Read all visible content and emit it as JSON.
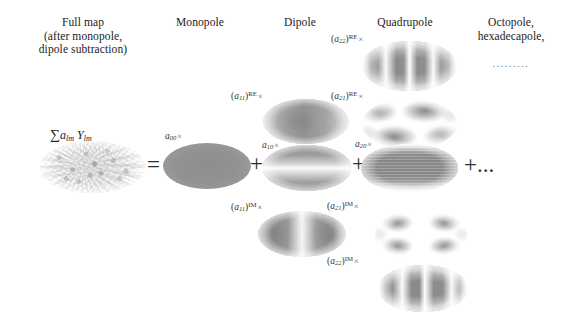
{
  "figure": {
    "type": "spherical-harmonic-decomposition"
  },
  "headers": {
    "full_map": "Full map\n(after monopole,\ndipole subtraction)",
    "monopole": "Monopole",
    "dipole": "Dipole",
    "quadrupole": "Quadrupole",
    "octopole": "Octopole,\nhexadecapole,",
    "octopole_dots": "........."
  },
  "equation": {
    "sum_label_sigma": "∑",
    "sum_label_a": "a",
    "sum_label_a_sub": "lm",
    "sum_label_y": "Y",
    "sum_label_y_sub": "lm",
    "equals": "=",
    "plus_1": "+",
    "plus_2": "+",
    "plus_3": "+",
    "tail": "+..."
  },
  "coefficients": {
    "a00": {
      "base": "a",
      "sub": "00",
      "sup": "",
      "times": "×"
    },
    "a11_re": {
      "base": "a",
      "sub": "11",
      "sup": "RE",
      "times": "×",
      "paren": true
    },
    "a10": {
      "base": "a",
      "sub": "10",
      "sup": "",
      "times": "×"
    },
    "a11_im": {
      "base": "a",
      "sub": "11",
      "sup": "IM",
      "times": "×",
      "paren": true
    },
    "a22_re": {
      "base": "a",
      "sub": "22",
      "sup": "RE",
      "times": "×",
      "paren": true
    },
    "a21_re": {
      "base": "a",
      "sub": "21",
      "sup": "RE",
      "times": "×",
      "paren": true
    },
    "a20": {
      "base": "a",
      "sub": "20",
      "sup": "",
      "times": "×"
    },
    "a21_im": {
      "base": "a",
      "sub": "21",
      "sup": "IM",
      "times": "×",
      "paren": true
    },
    "a22_im": {
      "base": "a",
      "sub": "22",
      "sup": "IM",
      "times": "×",
      "paren": true
    }
  },
  "maps": {
    "full_map": {
      "name": "full-sky-anisotropy-map",
      "pattern": "speckle-noise"
    },
    "monopole": {
      "name": "monopole-map",
      "pattern": "uniform"
    },
    "a11_re": {
      "name": "dipole-a11-re-map",
      "pattern": "east-west-dipole"
    },
    "a10": {
      "name": "dipole-a10-map",
      "pattern": "north-south-dipole"
    },
    "a11_im": {
      "name": "dipole-a11-im-map",
      "pattern": "east-west-dipole-shifted"
    },
    "a22_re": {
      "name": "quadrupole-a22-re-map",
      "pattern": "four-lobe-longitudinal"
    },
    "a21_re": {
      "name": "quadrupole-a21-re-map",
      "pattern": "diagonal-quadrupole"
    },
    "a20": {
      "name": "quadrupole-a20-map",
      "pattern": "banded-latitudinal"
    },
    "a21_im": {
      "name": "quadrupole-a21-im-map",
      "pattern": "cross-quadrupole"
    },
    "a22_im": {
      "name": "quadrupole-a22-im-map",
      "pattern": "four-lobe-shifted"
    }
  },
  "colors": {
    "ink": "#1a1a1a",
    "grey_dark": "#8c8c8c",
    "grey_mid": "#a8a8a8",
    "grey_light": "#d6d6d6",
    "background": "#ffffff"
  }
}
